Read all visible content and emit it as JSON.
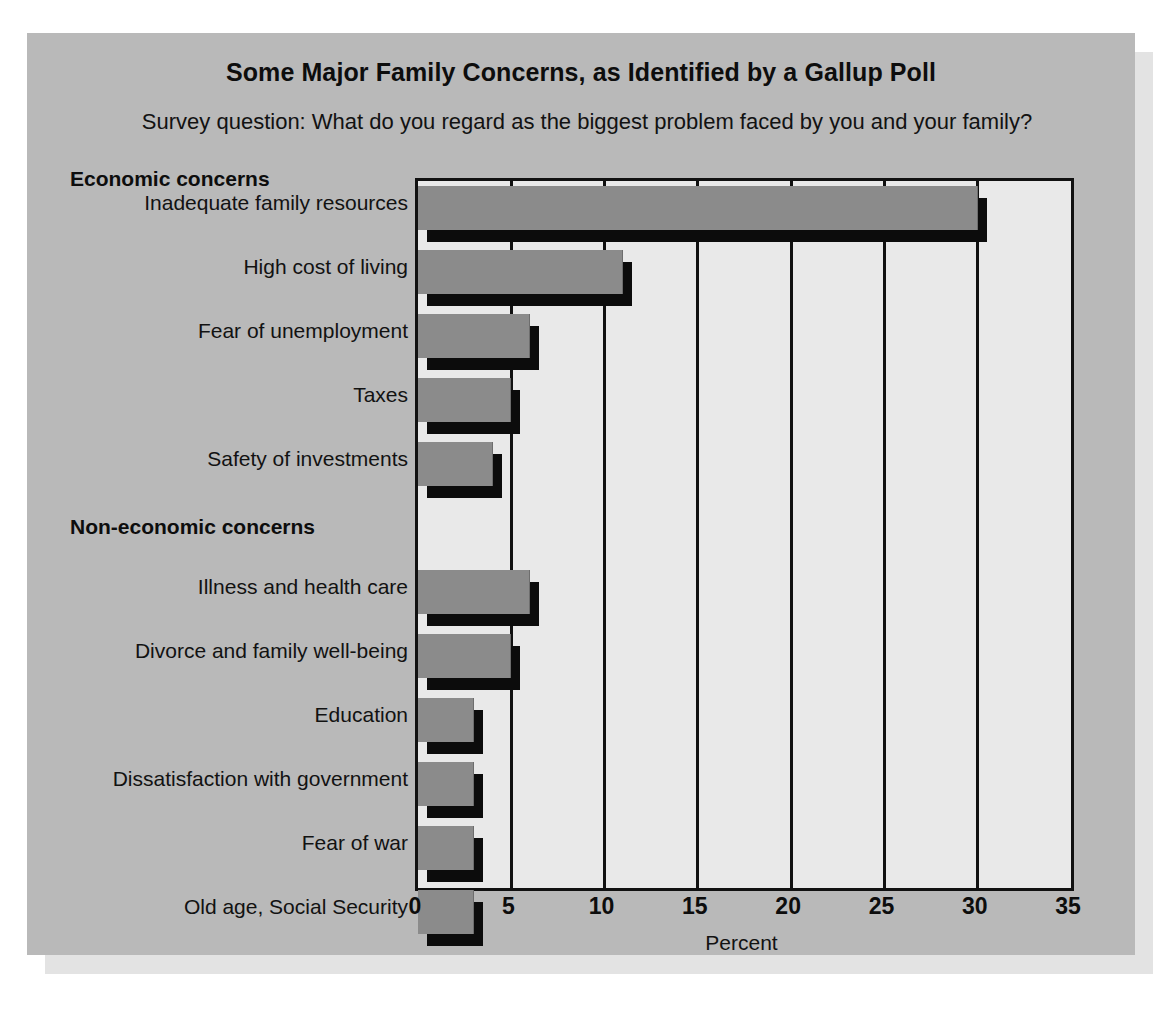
{
  "figure": {
    "title": "Some Major Family Concerns, as Identified by a Gallup Poll",
    "subtitle": "Survey question: What do you regard as the biggest problem faced by you and your family?",
    "group_headings": {
      "economic": "Economic concerns",
      "non_economic": "Non-economic concerns"
    }
  },
  "chart_data": {
    "type": "bar",
    "orientation": "horizontal",
    "title": "Some Major Family Concerns, as Identified by a Gallup Poll",
    "subtitle": "Survey question: What do you regard as the biggest problem faced by you and your family?",
    "xlabel": "Percent",
    "ylabel": "",
    "xlim": [
      0,
      35
    ],
    "xticks": [
      "0",
      "5",
      "10",
      "15",
      "20",
      "25",
      "30",
      "35"
    ],
    "xtick_values": [
      0,
      5,
      10,
      15,
      20,
      25,
      30,
      35
    ],
    "grid": "vertical",
    "legend": "none",
    "groups": [
      {
        "name": "Economic concerns",
        "categories": [
          "Inadequate family resources",
          "High cost of living",
          "Fear of unemployment",
          "Taxes",
          "Safety of investments"
        ],
        "values": [
          30,
          11,
          6,
          5,
          4
        ]
      },
      {
        "name": "Non-economic concerns",
        "categories": [
          "Illness and health care",
          "Divorce and family well-being",
          "Education",
          "Dissatisfaction with government",
          "Fear of war",
          "Old age, Social Security"
        ],
        "values": [
          6,
          5,
          3,
          3,
          3,
          3
        ]
      }
    ],
    "categories": [
      "Inadequate family resources",
      "High cost of living",
      "Fear of unemployment",
      "Taxes",
      "Safety of investments",
      "Illness and health care",
      "Divorce and family well-being",
      "Education",
      "Dissatisfaction with government",
      "Fear of war",
      "Old age, Social Security"
    ],
    "values": [
      30,
      11,
      6,
      5,
      4,
      6,
      5,
      3,
      3,
      3,
      3
    ]
  },
  "colors": {
    "page_background": "#ffffff",
    "panel_background": "#b9b9b9",
    "panel_shadow": "#e3e3e3",
    "plot_background": "#e9e9e9",
    "bar_face": "#8b8b8b",
    "bar_shadow": "#0c0c0c",
    "axis_line": "#111111",
    "text": "#121212"
  }
}
